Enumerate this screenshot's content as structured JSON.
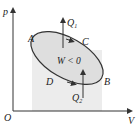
{
  "diagram": {
    "axes": {
      "y_label": "p",
      "x_label": "V",
      "origin_label": "O"
    },
    "points": {
      "A": "A",
      "B": "B",
      "C": "C",
      "D": "D"
    },
    "work_label": "W < 0",
    "heat_top": {
      "symbol": "Q",
      "sub": "1"
    },
    "heat_bottom": {
      "symbol": "Q",
      "sub": "2"
    },
    "colors": {
      "fill": "#e3e3e3",
      "stroke": "#333333"
    }
  }
}
